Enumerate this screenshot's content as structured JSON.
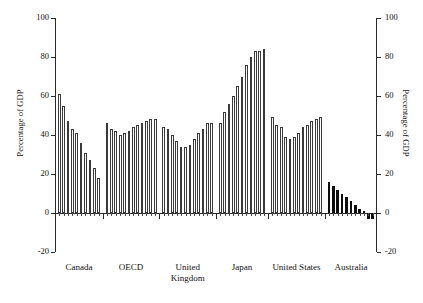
{
  "chart_data": {
    "type": "bar",
    "title": "",
    "xlabel": "",
    "ylabel": "Percentage of GDP",
    "ylabel_right": "Percentage of GDP",
    "ylim": [
      -20,
      100
    ],
    "yticks": [
      -20,
      0,
      20,
      40,
      60,
      80,
      100
    ],
    "ytick_labels": [
      "-20",
      "0",
      "20",
      "40",
      "60",
      "80",
      "100"
    ],
    "grid": false,
    "legend": "none",
    "categories": [
      "Canada",
      "OECD",
      "United Kingdom",
      "Japan",
      "United States",
      "Australia"
    ],
    "groups": [
      {
        "name": "Canada",
        "label": "Canada",
        "fill": "hollow",
        "values": [
          61,
          55,
          47,
          43,
          41,
          36,
          31,
          27,
          23,
          18
        ]
      },
      {
        "name": "OECD",
        "label": "OECD",
        "fill": "hollow",
        "values": [
          46,
          43,
          42,
          40,
          41,
          42,
          44,
          45,
          46,
          47,
          48,
          48
        ]
      },
      {
        "name": "United Kingdom",
        "label": "United\nKingdom",
        "fill": "hollow",
        "values": [
          44,
          43,
          40,
          37,
          34,
          34,
          35,
          38,
          41,
          43,
          46,
          46
        ]
      },
      {
        "name": "Japan",
        "label": "Japan",
        "fill": "hollow",
        "values": [
          46,
          52,
          56,
          60,
          65,
          70,
          76,
          80,
          83,
          83,
          84
        ]
      },
      {
        "name": "United States",
        "label": "United States",
        "fill": "hollow",
        "values": [
          49,
          45,
          44,
          39,
          38,
          39,
          41,
          44,
          45,
          47,
          48,
          49
        ]
      },
      {
        "name": "Australia",
        "label": "Australia",
        "fill": "solid",
        "values": [
          16,
          14,
          12,
          10,
          8,
          6,
          4,
          2,
          1,
          -3,
          -3
        ]
      }
    ],
    "colors": {
      "hollow_bar_fill": "#ffffff",
      "hollow_bar_edge": "#3a3a3a",
      "solid_bar_fill": "#0d0d0d",
      "axis": "#2b2b2b",
      "background": "#ffffff",
      "text": "#111111"
    }
  }
}
